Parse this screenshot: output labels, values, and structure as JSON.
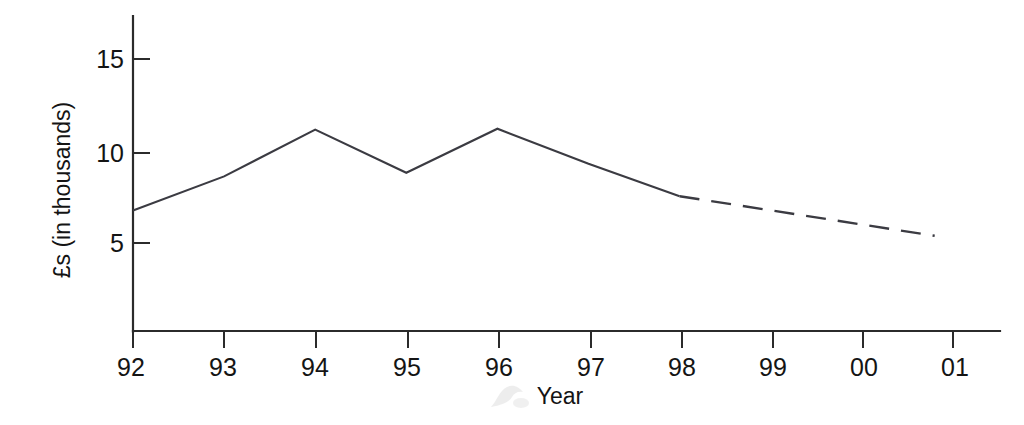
{
  "chart_data": {
    "type": "line",
    "title": "",
    "xlabel": "Year",
    "ylabel": "£s (in thousands)",
    "xlim": [
      1992,
      2001
    ],
    "ylim": [
      0,
      16.5
    ],
    "grid": false,
    "legend": "none",
    "x_tick_labels": [
      "92",
      "93",
      "94",
      "95",
      "96",
      "97",
      "98",
      "99",
      "00",
      "01"
    ],
    "x_tick_values": [
      1992,
      1993,
      1994,
      1995,
      1996,
      1997,
      1998,
      1999,
      2000,
      2001
    ],
    "y_tick_labels": [
      "5",
      "10",
      "15"
    ],
    "y_tick_values": [
      5,
      10,
      15
    ],
    "series": [
      {
        "name": "actual",
        "style": "solid",
        "x": [
          1992,
          1993,
          1994,
          1995,
          1996,
          1997,
          1998
        ],
        "values": [
          6.8,
          8.7,
          11.3,
          8.9,
          11.35,
          9.4,
          7.6
        ]
      },
      {
        "name": "forecast",
        "style": "dashed",
        "x": [
          1998,
          2000.8
        ],
        "values": [
          7.6,
          5.4
        ]
      }
    ],
    "annotations": []
  },
  "axes": {
    "y_axis_name": "y-axis",
    "x_axis_name": "x-axis"
  },
  "colors": {
    "line": "#3b3b42",
    "axis": "#2b2b2b",
    "text": "#141414",
    "background": "#ffffff"
  }
}
